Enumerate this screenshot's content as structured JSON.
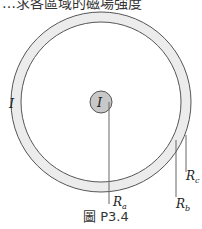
{
  "header": {
    "cropped_text": "…求各區域的磁場強度"
  },
  "figure": {
    "caption": "圖 P3.4",
    "labels": {
      "inner_current": "I",
      "outer_current": "I",
      "Ra": "R",
      "Ra_sub": "a",
      "Rb": "R",
      "Rb_sub": "b",
      "Rc": "R",
      "Rc_sub": "c"
    },
    "colors": {
      "shell_fill": "#ececec",
      "conductor_fill": "#c8c8c8",
      "stroke": "#555555",
      "leader": "#666666"
    }
  }
}
